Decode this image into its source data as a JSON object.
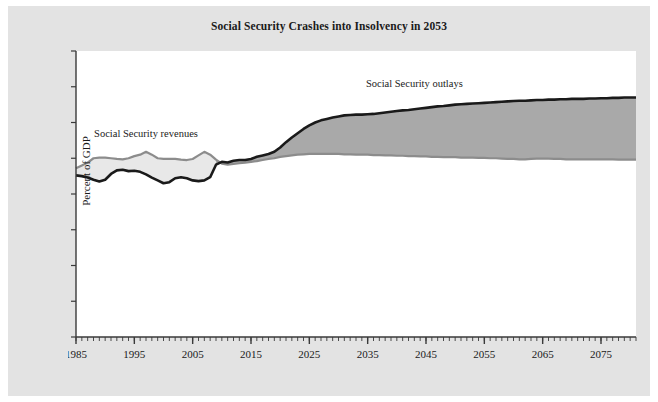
{
  "page": {
    "background": "#e3e3e3",
    "border": "#ffffff"
  },
  "chart_data": {
    "type": "area",
    "title": "Social Security Crashes into Insolvency in 2053",
    "xlabel": "",
    "ylabel": "Percent of GDP",
    "ylim": [
      0,
      8
    ],
    "xlim": [
      1985,
      2081
    ],
    "grid": false,
    "legend_position": "inline-annotation",
    "y_ticks": [
      "0",
      "1",
      "2",
      "3",
      "4",
      "5",
      "6",
      "7",
      "8"
    ],
    "x_ticks": [
      "1985",
      "1995",
      "2005",
      "2015",
      "2025",
      "2035",
      "2045",
      "2055",
      "2065",
      "2075"
    ],
    "x_minor_tick_interval": 1,
    "annotations": [
      {
        "text": "Social Security revenues",
        "x": 1997,
        "y": 5.6
      },
      {
        "text": "Social Security outlays",
        "x": 2043,
        "y": 7.0
      }
    ],
    "colors": {
      "outlays_line": "#1a1a1a",
      "revenues_line": "#8c8c8c",
      "deficit_fill": "#a9a9a9",
      "surplus_fill": "#e8e8e8",
      "plot_background": "#ffffff",
      "axis": "#3a3a3a"
    },
    "x": [
      1985,
      1986,
      1987,
      1988,
      1989,
      1990,
      1991,
      1992,
      1993,
      1994,
      1995,
      1996,
      1997,
      1998,
      1999,
      2000,
      2001,
      2002,
      2003,
      2004,
      2005,
      2006,
      2007,
      2008,
      2009,
      2010,
      2011,
      2012,
      2013,
      2014,
      2015,
      2016,
      2017,
      2018,
      2019,
      2020,
      2021,
      2022,
      2023,
      2024,
      2025,
      2026,
      2027,
      2028,
      2029,
      2030,
      2031,
      2032,
      2033,
      2034,
      2035,
      2036,
      2037,
      2038,
      2039,
      2040,
      2041,
      2042,
      2043,
      2044,
      2045,
      2046,
      2047,
      2048,
      2049,
      2050,
      2051,
      2052,
      2053,
      2054,
      2055,
      2056,
      2057,
      2058,
      2059,
      2060,
      2061,
      2062,
      2063,
      2064,
      2065,
      2066,
      2067,
      2068,
      2069,
      2070,
      2071,
      2072,
      2073,
      2074,
      2075,
      2076,
      2077,
      2078,
      2079,
      2080,
      2081
    ],
    "series": [
      {
        "name": "Social Security outlays",
        "color": "#1a1a1a",
        "values": [
          4.52,
          4.5,
          4.46,
          4.4,
          4.35,
          4.4,
          4.56,
          4.66,
          4.68,
          4.64,
          4.65,
          4.62,
          4.55,
          4.46,
          4.38,
          4.3,
          4.33,
          4.44,
          4.47,
          4.44,
          4.38,
          4.36,
          4.38,
          4.47,
          4.82,
          4.9,
          4.88,
          4.93,
          4.95,
          4.95,
          4.98,
          5.04,
          5.08,
          5.12,
          5.18,
          5.3,
          5.45,
          5.58,
          5.7,
          5.82,
          5.92,
          6.0,
          6.06,
          6.1,
          6.14,
          6.17,
          6.2,
          6.21,
          6.22,
          6.22,
          6.23,
          6.24,
          6.26,
          6.28,
          6.3,
          6.32,
          6.34,
          6.35,
          6.37,
          6.39,
          6.41,
          6.43,
          6.45,
          6.46,
          6.48,
          6.5,
          6.51,
          6.52,
          6.53,
          6.54,
          6.55,
          6.56,
          6.57,
          6.58,
          6.59,
          6.6,
          6.61,
          6.61,
          6.62,
          6.63,
          6.63,
          6.64,
          6.64,
          6.65,
          6.65,
          6.66,
          6.66,
          6.66,
          6.67,
          6.67,
          6.68,
          6.68,
          6.69,
          6.69,
          6.7,
          6.7,
          6.7
        ]
      },
      {
        "name": "Social Security revenues",
        "color": "#8c8c8c",
        "values": [
          4.72,
          4.8,
          4.88,
          5.0,
          5.02,
          5.02,
          5.0,
          4.98,
          4.97,
          5.0,
          5.06,
          5.1,
          5.18,
          5.1,
          5.0,
          4.98,
          4.98,
          4.98,
          4.96,
          4.95,
          4.98,
          5.08,
          5.18,
          5.1,
          4.96,
          4.85,
          4.82,
          4.84,
          4.86,
          4.88,
          4.9,
          4.92,
          4.95,
          4.98,
          5.0,
          5.04,
          5.06,
          5.08,
          5.1,
          5.11,
          5.12,
          5.12,
          5.12,
          5.12,
          5.12,
          5.12,
          5.11,
          5.11,
          5.1,
          5.1,
          5.1,
          5.09,
          5.09,
          5.08,
          5.08,
          5.07,
          5.07,
          5.06,
          5.06,
          5.05,
          5.05,
          5.04,
          5.04,
          5.03,
          5.03,
          5.03,
          5.02,
          5.02,
          5.02,
          5.01,
          5.01,
          5.0,
          5.0,
          4.99,
          4.98,
          4.98,
          4.97,
          4.97,
          4.98,
          4.99,
          4.99,
          4.99,
          4.98,
          4.98,
          4.97,
          4.97,
          4.97,
          4.97,
          4.97,
          4.97,
          4.97,
          4.97,
          4.97,
          4.96,
          4.96,
          4.96,
          4.96
        ]
      }
    ]
  }
}
